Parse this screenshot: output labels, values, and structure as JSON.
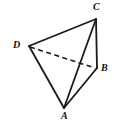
{
  "figure": {
    "name": "tetrahedron-abcd",
    "canvas": {
      "width": 114,
      "height": 122
    },
    "background_color": "#ffffff",
    "stroke_color": "#1a1a1a",
    "solid_stroke_width": 1.8,
    "dashed_stroke_width": 1.6,
    "dash_pattern": "5,3.5",
    "label_color": "#111111",
    "vertices": [
      {
        "id": "C",
        "label": "C",
        "x": 96,
        "y": 19,
        "label_x": 93,
        "label_y": 2
      },
      {
        "id": "D",
        "label": "D",
        "x": 29,
        "y": 46,
        "label_x": 13,
        "label_y": 40
      },
      {
        "id": "B",
        "label": "B",
        "x": 96,
        "y": 68,
        "label_x": 101,
        "label_y": 63
      },
      {
        "id": "A",
        "label": "A",
        "x": 64,
        "y": 108,
        "label_x": 61,
        "label_y": 111
      }
    ],
    "edges": [
      {
        "id": "CD",
        "from": "C",
        "to": "D",
        "style": "solid",
        "x1": 96,
        "y1": 19,
        "x2": 29,
        "y2": 46
      },
      {
        "id": "CB",
        "from": "C",
        "to": "B",
        "style": "solid",
        "x1": 96,
        "y1": 19,
        "x2": 97,
        "y2": 68
      },
      {
        "id": "CA",
        "from": "C",
        "to": "A",
        "style": "solid",
        "x1": 96,
        "y1": 19,
        "x2": 64,
        "y2": 108
      },
      {
        "id": "DA",
        "from": "D",
        "to": "A",
        "style": "solid",
        "x1": 29,
        "y1": 46,
        "x2": 64,
        "y2": 108
      },
      {
        "id": "AB",
        "from": "A",
        "to": "B",
        "style": "solid",
        "x1": 64,
        "y1": 108,
        "x2": 97,
        "y2": 68
      },
      {
        "id": "DB",
        "from": "D",
        "to": "B",
        "style": "dashed",
        "x1": 30,
        "y1": 47,
        "x2": 95,
        "y2": 68
      }
    ],
    "artifacts": [
      {
        "id": "speck",
        "x": 43,
        "y": 112,
        "radius": 0.7,
        "color": "#cccccc"
      }
    ]
  }
}
